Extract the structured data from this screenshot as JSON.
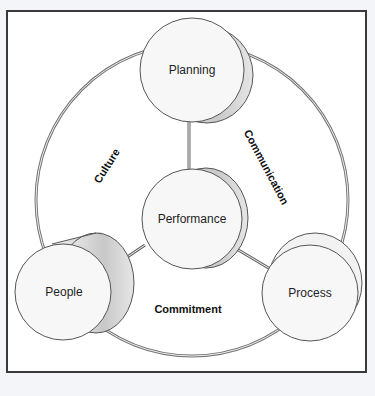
{
  "diagram": {
    "nodes": {
      "center": {
        "label": "Performance"
      },
      "top": {
        "label": "Planning"
      },
      "left": {
        "label": "People"
      },
      "right": {
        "label": "Process"
      }
    },
    "ring_labels": {
      "left_arc": "Culture",
      "right_arc": "Communication",
      "bottom_arc": "Commitment"
    },
    "colors": {
      "frame_border": "#3a3a3a",
      "circle_fill": "#f7f7f7",
      "shadow_fill": "#cfcfcf",
      "line": "#555555",
      "background": "#ffffff"
    }
  }
}
